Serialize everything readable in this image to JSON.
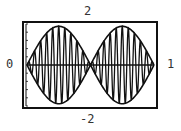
{
  "window": {
    "xmin_label": "0",
    "xmax_label": "1",
    "ymin_label": "-2",
    "ymax_label": "2"
  },
  "chart_data": {
    "type": "line",
    "title": "",
    "xlabel": "",
    "ylabel": "",
    "xlim": [
      0,
      1
    ],
    "ylim": [
      -2,
      2
    ],
    "grid": false,
    "legend": null,
    "y_ticks_count": 10,
    "series": [
      {
        "name": "upper envelope",
        "formula": "1.8*|sin(2*pi*x)|",
        "samples": 200
      },
      {
        "name": "lower envelope",
        "formula": "-1.8*|sin(2*pi*x)|",
        "samples": 200
      },
      {
        "name": "beat wave",
        "formula": "1.8*sin(2*pi*x)*sin(2*pi*21*x)",
        "samples": 1200
      },
      {
        "name": "x-axis",
        "formula": "0",
        "samples": 2
      }
    ],
    "annotations": [
      "node at x=0.5 where envelope crosses zero"
    ]
  },
  "colors": {
    "line": "#111111",
    "frame": "#111111",
    "background": "#ffffff"
  }
}
